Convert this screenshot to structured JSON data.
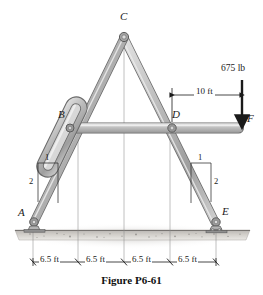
{
  "figure": {
    "caption": "Figure P6-61",
    "type": "statics-frame-diagram"
  },
  "points": [
    {
      "id": "A",
      "label": "A",
      "x": 33,
      "y": 224,
      "support": "pin"
    },
    {
      "id": "B",
      "label": "B",
      "x": 70,
      "y": 128,
      "support": "pin-in-slot"
    },
    {
      "id": "C",
      "label": "C",
      "x": 124,
      "y": 36,
      "support": "pin"
    },
    {
      "id": "D",
      "label": "D",
      "x": 172,
      "y": 128,
      "support": "pin"
    },
    {
      "id": "E",
      "label": "E",
      "x": 216,
      "y": 224,
      "support": "roller"
    },
    {
      "id": "F",
      "label": "F",
      "x": 242,
      "y": 128,
      "support": "free-end"
    }
  ],
  "load": {
    "magnitude": "675 lb",
    "direction": "down",
    "applied_at": "F"
  },
  "dimensions": {
    "horizontal_label": "10 ft",
    "baseline": [
      "6.5 ft",
      "6.5 ft",
      "6.5 ft",
      "6.5 ft"
    ],
    "slope_left": {
      "rise": "1",
      "run": "2"
    },
    "slope_right": {
      "rise": "1",
      "run": "2"
    }
  },
  "colors": {
    "member_fill": "#b8b8b8",
    "member_edge": "#5a5a5a",
    "ground": "#c9c6c2",
    "ink": "#1a1a1a"
  }
}
